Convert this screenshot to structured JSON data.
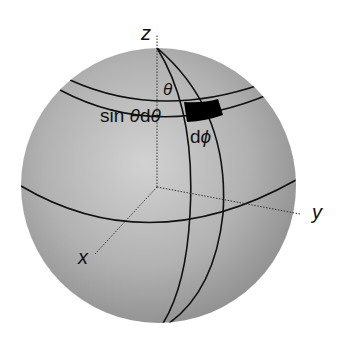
{
  "diagram": {
    "type": "spherical-coordinate-area-element",
    "labels": {
      "z_axis": "z",
      "y_axis": "y",
      "x_axis": "x",
      "theta": "θ",
      "band_width": "sin θ dθ",
      "band_width_sin": "sin ",
      "band_width_theta": "θ",
      "band_width_d": "d",
      "band_width_theta2": "θ",
      "dphi_d": "d",
      "dphi_phi": "ϕ"
    },
    "colors": {
      "sphere_light": "#d4d4d4",
      "sphere_mid": "#aaaaaa",
      "sphere_dark": "#8a8a8a",
      "line": "#111111",
      "patch": "#000000",
      "background": "#ffffff"
    }
  }
}
